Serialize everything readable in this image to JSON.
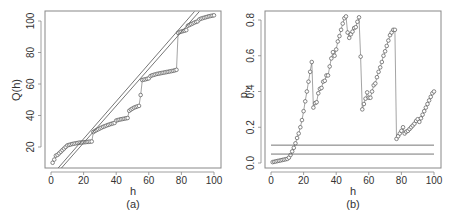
{
  "chart_data": [
    {
      "type": "scatter",
      "panel_label": "(a)",
      "title": "",
      "xlabel": "h",
      "ylabel": "Q(h)",
      "xlim": [
        -2,
        104
      ],
      "ylim": [
        6,
        106
      ],
      "xticks": [
        0,
        20,
        40,
        60,
        80,
        100
      ],
      "yticks": [
        20,
        40,
        60,
        80,
        100
      ],
      "grid": false,
      "legend": null,
      "series": [
        {
          "name": "Q(h)",
          "style": "points-open-circle-connected",
          "x": [
            1,
            2,
            3,
            4,
            5,
            6,
            7,
            8,
            9,
            10,
            11,
            12,
            13,
            14,
            15,
            16,
            17,
            18,
            19,
            20,
            21,
            22,
            23,
            24,
            25,
            26,
            27,
            28,
            29,
            30,
            31,
            32,
            33,
            34,
            35,
            36,
            37,
            38,
            39,
            40,
            41,
            42,
            43,
            44,
            45,
            46,
            47,
            48,
            49,
            50,
            51,
            52,
            53,
            54,
            55,
            56,
            57,
            58,
            59,
            60,
            61,
            62,
            63,
            64,
            65,
            66,
            67,
            68,
            69,
            70,
            71,
            72,
            73,
            74,
            75,
            76,
            77,
            78,
            79,
            80,
            81,
            82,
            83,
            84,
            85,
            86,
            87,
            88,
            89,
            90,
            91,
            92,
            93,
            94,
            95,
            96,
            97,
            98,
            99,
            100
          ],
          "y": [
            10,
            12,
            14.5,
            15,
            16,
            17,
            18,
            19,
            20,
            21,
            21.3,
            21.6,
            21.9,
            22.1,
            22.3,
            22.5,
            22.7,
            22.8,
            22.9,
            23.0,
            23.1,
            23.2,
            23.3,
            23.4,
            23.5,
            29.5,
            30.2,
            30.8,
            31.3,
            31.8,
            32.3,
            32.8,
            33.2,
            33.6,
            34.0,
            34.4,
            34.7,
            35.0,
            35.3,
            36.8,
            37.1,
            37.4,
            37.6,
            37.8,
            38.0,
            38.2,
            38.4,
            43.0,
            43.8,
            44.4,
            45.0,
            45.4,
            45.8,
            46.1,
            53.0,
            62.5,
            62.8,
            63.0,
            63.3,
            63.6,
            65.0,
            65.5,
            65.8,
            66.1,
            66.4,
            66.6,
            66.8,
            67.0,
            67.2,
            67.4,
            67.6,
            67.8,
            68.0,
            68.2,
            68.4,
            68.7,
            69.0,
            92.5,
            93.0,
            93.3,
            93.6,
            93.9,
            94.2,
            97.0,
            97.5,
            98.0,
            98.5,
            99.0,
            99.4,
            99.8,
            101.0,
            101.5,
            101.8,
            102.1,
            102.4,
            102.7,
            103.0,
            103.2,
            103.4,
            103.6
          ]
        },
        {
          "name": "bound line 1",
          "style": "line",
          "x": [
            3,
            88
          ],
          "y": [
            5,
            106
          ]
        },
        {
          "name": "bound line 2",
          "style": "line",
          "x": [
            5,
            91
          ],
          "y": [
            5,
            106
          ]
        }
      ]
    },
    {
      "type": "scatter",
      "panel_label": "(b)",
      "title": "",
      "xlabel": "h",
      "ylabel": "p_h",
      "xlim": [
        -2,
        104
      ],
      "ylim": [
        -0.03,
        0.84
      ],
      "xticks": [
        0,
        20,
        40,
        60,
        80,
        100
      ],
      "yticks": [
        0.0,
        0.2,
        0.4,
        0.6,
        0.8
      ],
      "grid": false,
      "legend": null,
      "series": [
        {
          "name": "p_h",
          "style": "points-open-circle-connected",
          "x": [
            1,
            2,
            3,
            4,
            5,
            6,
            7,
            8,
            9,
            10,
            11,
            12,
            13,
            14,
            15,
            16,
            17,
            18,
            19,
            20,
            21,
            22,
            23,
            24,
            25,
            26,
            27,
            28,
            29,
            30,
            31,
            32,
            33,
            34,
            35,
            36,
            37,
            38,
            39,
            40,
            41,
            42,
            43,
            44,
            45,
            46,
            47,
            48,
            49,
            50,
            51,
            52,
            53,
            54,
            55,
            56,
            57,
            58,
            59,
            60,
            61,
            62,
            63,
            64,
            65,
            66,
            67,
            68,
            69,
            70,
            71,
            72,
            73,
            74,
            75,
            76,
            77,
            78,
            79,
            80,
            81,
            82,
            83,
            84,
            85,
            86,
            87,
            88,
            89,
            90,
            91,
            92,
            93,
            94,
            95,
            96,
            97,
            98,
            99,
            100
          ],
          "y": [
            0.005,
            0.007,
            0.009,
            0.011,
            0.013,
            0.015,
            0.017,
            0.019,
            0.021,
            0.023,
            0.03,
            0.045,
            0.065,
            0.085,
            0.11,
            0.14,
            0.165,
            0.2,
            0.24,
            0.29,
            0.345,
            0.4,
            0.455,
            0.51,
            0.565,
            0.31,
            0.335,
            0.34,
            0.39,
            0.415,
            0.42,
            0.455,
            0.46,
            0.49,
            0.49,
            0.54,
            0.585,
            0.62,
            0.6,
            0.635,
            0.68,
            0.71,
            0.745,
            0.78,
            0.81,
            0.82,
            0.73,
            0.7,
            0.72,
            0.735,
            0.755,
            0.76,
            0.79,
            0.815,
            0.595,
            0.3,
            0.33,
            0.36,
            0.395,
            0.365,
            0.365,
            0.4,
            0.435,
            0.445,
            0.48,
            0.51,
            0.535,
            0.565,
            0.6,
            0.625,
            0.655,
            0.685,
            0.715,
            0.73,
            0.745,
            0.745,
            0.135,
            0.15,
            0.165,
            0.18,
            0.2,
            0.165,
            0.175,
            0.18,
            0.19,
            0.2,
            0.21,
            0.22,
            0.235,
            0.245,
            0.23,
            0.25,
            0.27,
            0.29,
            0.31,
            0.33,
            0.35,
            0.37,
            0.39,
            0.4
          ]
        },
        {
          "name": "threshold 0.10",
          "style": "hline",
          "y": 0.1
        },
        {
          "name": "threshold 0.05",
          "style": "hline",
          "y": 0.05
        }
      ]
    }
  ],
  "panels": {
    "a": {
      "label": "(a)",
      "xlabel": "h",
      "ylabel": "Q(h)",
      "xtick_labels": [
        "0",
        "20",
        "40",
        "60",
        "80",
        "100"
      ],
      "ytick_labels": [
        "20",
        "40",
        "60",
        "80",
        "100"
      ]
    },
    "b": {
      "label": "(b)",
      "xlabel": "h",
      "ylabel": "p",
      "ylabel_sub": "h",
      "xtick_labels": [
        "0",
        "20",
        "40",
        "60",
        "80",
        "100"
      ],
      "ytick_labels": [
        "0.0",
        "0.2",
        "0.4",
        "0.6",
        "0.8"
      ]
    }
  },
  "colors": {
    "points": "#555555",
    "lines": "#666666",
    "frame": "#888888",
    "text": "#333333"
  }
}
